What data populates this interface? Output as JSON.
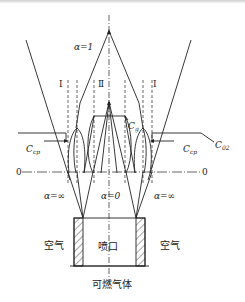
{
  "diagram": {
    "labels": {
      "alpha_one": "α=1",
      "alpha_zero": "α=0",
      "alpha_inf_left": "α=∞",
      "alpha_inf_right": "α=∞",
      "zone_I_left": "Ⅰ",
      "zone_II": "Ⅱ",
      "zone_I_right": "Ⅰ",
      "c_cp_left": "C",
      "c_cp_left_sub": "cp",
      "c_cp_right": "C",
      "c_cp_right_sub": "cp",
      "c_g": "C",
      "c_g_sub": "g",
      "c_02": "C",
      "c_02_sub": "02",
      "zero_left": "0",
      "zero_right": "0",
      "air_left": "空气",
      "air_right": "空气",
      "nozzle": "喷口",
      "fuel_gas": "可燃气体"
    },
    "colors": {
      "line": "#222222",
      "background": "#ffffff"
    }
  }
}
